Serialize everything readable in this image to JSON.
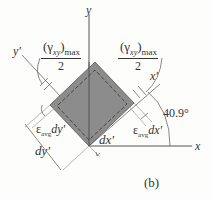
{
  "figure": {
    "panel_label": "(b)",
    "axes": {
      "x": "x",
      "y": "y",
      "x_prime": "x'",
      "y_prime": "y'"
    },
    "angle_label": "40.9°",
    "shear_labels": {
      "left": {
        "gamma": "(γ",
        "sub": "xy",
        "close": ")",
        "max": "max",
        "den": "2"
      },
      "right": {
        "gamma": "(γ",
        "sub": "xy",
        "close": ")",
        "max": "max",
        "den": "2"
      }
    },
    "strain_labels": {
      "eps_dy": {
        "eps": "ε",
        "sub": "avg",
        "tail": "dy'"
      },
      "eps_dx": {
        "eps": "ε",
        "sub": "avg",
        "tail": "dx'"
      }
    },
    "dimension_labels": {
      "dy": "dy'",
      "dx": "dx'"
    },
    "colors": {
      "element_fill": "#8c8c8c",
      "lines": "#555555",
      "background": "#fdfdfc"
    }
  }
}
